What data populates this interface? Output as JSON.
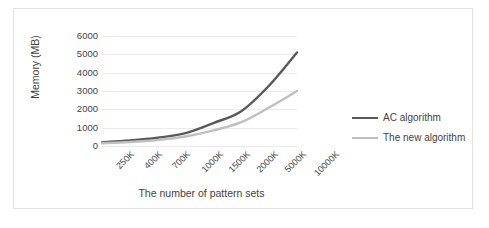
{
  "chart_data": {
    "type": "line",
    "title": "",
    "xlabel": "The number of pattern sets",
    "ylabel": "Memory (MB)",
    "categories": [
      "250K",
      "400K",
      "700K",
      "1000K",
      "1500K",
      "2000K",
      "5000K",
      "10000K"
    ],
    "yticks": [
      0,
      1000,
      2000,
      3000,
      4000,
      5000,
      6000
    ],
    "ylim": [
      0,
      6000
    ],
    "grid": true,
    "legend_position": "right",
    "series": [
      {
        "name": "AC algorithm",
        "color": "#595959",
        "values": [
          200,
          300,
          450,
          700,
          1250,
          1900,
          3300,
          5100
        ]
      },
      {
        "name": "The new algorithm",
        "color": "#bfbfbf",
        "values": [
          150,
          220,
          330,
          520,
          850,
          1300,
          2100,
          3000
        ]
      }
    ]
  },
  "axes": {
    "y_title": "Memory (MB)",
    "x_title": "The number of pattern sets"
  },
  "legend": {
    "entries": [
      {
        "label": "AC algorithm",
        "color": "#595959"
      },
      {
        "label": "The new algorithm",
        "color": "#bfbfbf"
      }
    ]
  }
}
